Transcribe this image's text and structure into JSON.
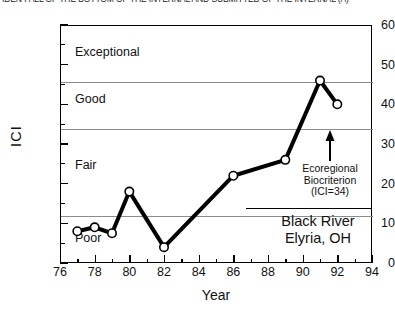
{
  "caption": {
    "text": "IDEN FALL OF THE BOTTOM OF THE INTERNAL AND SUBMITTED OF THE INTERNAL (A)"
  },
  "chart_data": {
    "type": "line",
    "title": "",
    "xlabel": "Year",
    "ylabel": "ICI",
    "xlim": [
      76,
      94
    ],
    "ylim": [
      0,
      60
    ],
    "xticks": [
      76,
      78,
      80,
      82,
      84,
      86,
      88,
      90,
      92,
      94
    ],
    "yticks": [
      0,
      10,
      20,
      30,
      40,
      50,
      60
    ],
    "xtick_step_minor": 1,
    "ytick_step_minor": 5,
    "grid": false,
    "legend": "none",
    "marker": "open-circle",
    "series": [
      {
        "name": "ICI",
        "x": [
          77,
          78,
          79,
          80,
          82,
          86,
          89,
          91,
          92
        ],
        "values": [
          8,
          9,
          7.5,
          18,
          4,
          22,
          26,
          46,
          40
        ]
      }
    ],
    "bands": [
      {
        "label": "Exceptional",
        "lower": 46,
        "upper": 60,
        "label_y": 53
      },
      {
        "label": "Good",
        "lower": 34,
        "upper": 46,
        "label_y": 41
      },
      {
        "label": "Fair",
        "lower": 12,
        "upper": 34,
        "label_y": 21
      },
      {
        "label": "Poor",
        "lower": 0,
        "upper": 12,
        "label_y": 7
      }
    ],
    "band_lines": [
      46,
      34,
      12
    ],
    "annotations": [
      {
        "name": "ecoregional-biocriterion",
        "lines": [
          "Ecoregional",
          "Biocriterion",
          "(ICI=34)"
        ],
        "arrow_target_value": 34,
        "arrow_x_year": 91.5
      },
      {
        "name": "site-label",
        "lines": [
          "Black River",
          "Elyria, OH"
        ]
      }
    ],
    "colors": {
      "line": "#000000",
      "marker_fill": "#ffffff",
      "marker_stroke": "#000000",
      "axis": "#000000",
      "band_line": "#8c8c8c",
      "background": "#ffffff"
    }
  }
}
